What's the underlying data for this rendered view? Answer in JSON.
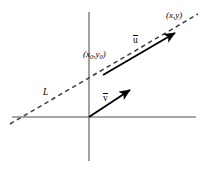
{
  "figure": {
    "background_color": "#ffffff",
    "width": 207,
    "height": 177
  },
  "colors": {
    "axis": "#8a8a8a",
    "line_L": "#3f3f3f",
    "vector": "#000000",
    "label": "#000000"
  },
  "axes": {
    "x_axis": {
      "name": "x-axis",
      "x1": 12,
      "y1": 117,
      "x2": 196,
      "y2": 117
    },
    "y_axis": {
      "name": "y-axis",
      "x1": 89,
      "y1": 12,
      "x2": 89,
      "y2": 161
    },
    "origin": {
      "x": 89,
      "y": 117
    }
  },
  "line": {
    "name": "L",
    "label": "L",
    "style": "dashed",
    "x1": 10,
    "y1": 124,
    "x2": 198,
    "y2": 14
  },
  "vectors": [
    {
      "name": "u",
      "label": "u",
      "overbar": true,
      "from": {
        "x": 103,
        "y": 75
      },
      "to": {
        "x": 178,
        "y": 31
      }
    },
    {
      "name": "v",
      "label": "v",
      "overbar": true,
      "from": {
        "x": 89,
        "y": 117
      },
      "to": {
        "x": 133,
        "y": 88
      }
    }
  ],
  "points": [
    {
      "name": "point-x0-y0",
      "open": "(",
      "var1": "x",
      "sub1": "0",
      "comma": ",",
      "var2": "y",
      "sub2": "0",
      "close": ")",
      "x": 103,
      "y": 75
    },
    {
      "name": "point-x-y",
      "open": "(",
      "var1": "x",
      "comma": ",",
      "var2": "y",
      "close": ")",
      "x": 178,
      "y": 31
    }
  ]
}
